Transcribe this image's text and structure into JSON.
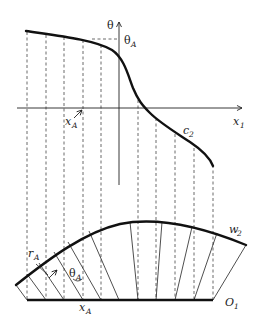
{
  "figure": {
    "labels": {
      "theta_axis": "θ",
      "theta_A": "θ",
      "theta_A_sub": "A",
      "x1_axis": "x",
      "x1_sub": "1",
      "xA_top": "x",
      "xA_top_sub": "A",
      "c2": "c",
      "c2_sub": "2",
      "w2": "w",
      "w2_sub": "2",
      "rA": "r",
      "rA_sub": "A",
      "thetaA_bottom": "θ",
      "thetaA_bottom_sub": "A",
      "xA_bottom": "x",
      "xA_bottom_sub": "A",
      "O1": "O",
      "O1_sub": "1"
    },
    "colors": {
      "ink": "#222222",
      "dash": "#444444",
      "background": "#ffffff"
    }
  }
}
